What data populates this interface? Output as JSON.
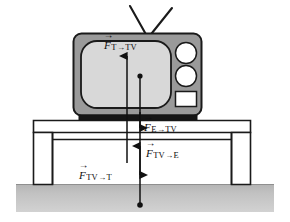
{
  "figure": {
    "width": 290,
    "height": 222,
    "background_color": "#ffffff"
  },
  "objects": {
    "television": {
      "name": "television",
      "body_color": "#9a9a9a",
      "screen_color": "#d8d8d8",
      "outline_color": "#1a1a1a",
      "antenna": "v-shaped rabbit-ear antenna",
      "knob_count": 2,
      "knob_color": "#ffffff",
      "panel_color": "#ffffff",
      "base_color": "#1a1a1a"
    },
    "table": {
      "name": "table",
      "fill_color": "#ffffff",
      "outline_color": "#1a1a1a",
      "leg_count": 2
    },
    "ground": {
      "name": "ground",
      "fill_color": "#bfbfbf",
      "label": "ground"
    },
    "dots": [
      {
        "name": "tv-center-of-mass-dot",
        "color": "#111111"
      },
      {
        "name": "earth-center-dot",
        "color": "#111111"
      }
    ]
  },
  "forces": [
    {
      "id": "t-tv",
      "symbol": "F",
      "subscript_from": "T",
      "subscript_arrow": "→",
      "subscript_to": "TV",
      "full_label": "F⃗ T→TV",
      "description": "force of Table on TV",
      "direction": "up"
    },
    {
      "id": "e-tv",
      "symbol": "F",
      "subscript_from": "E",
      "subscript_arrow": "→",
      "subscript_to": "TV",
      "full_label": "F⃗ E→TV",
      "description": "force of Earth on TV",
      "direction": "down"
    },
    {
      "id": "tv-e",
      "symbol": "F",
      "subscript_from": "TV",
      "subscript_arrow": "→",
      "subscript_to": "E",
      "full_label": "F⃗ TV→E",
      "description": "force of TV on Earth",
      "direction": "up"
    },
    {
      "id": "tv-t",
      "symbol": "F",
      "subscript_from": "TV",
      "subscript_arrow": "→",
      "subscript_to": "T",
      "full_label": "F⃗ TV→T",
      "description": "force of TV on Table",
      "direction": "down"
    }
  ],
  "colors": {
    "ink": "#1a1a1a",
    "tv_body": "#9a9a9a",
    "tv_screen": "#d8d8d8",
    "ground": "#bfbfbf",
    "white": "#ffffff"
  }
}
